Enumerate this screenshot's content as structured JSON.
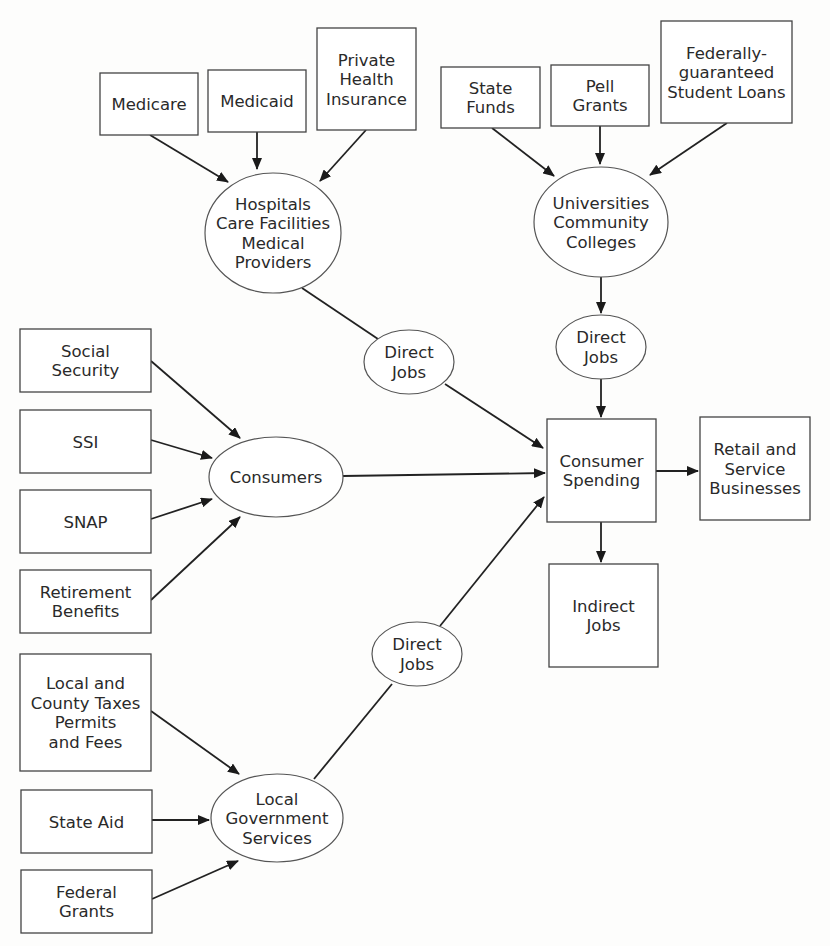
{
  "diagram": {
    "type": "flowchart",
    "nodes": [
      {
        "id": "medicare",
        "shape": "box",
        "lines": [
          "Medicare"
        ],
        "x": 100,
        "y": 73,
        "w": 98,
        "h": 62
      },
      {
        "id": "medicaid",
        "shape": "box",
        "lines": [
          "Medicaid"
        ],
        "x": 208,
        "y": 70,
        "w": 98,
        "h": 62
      },
      {
        "id": "private_health_insurance",
        "shape": "box",
        "lines": [
          "Private",
          "Health",
          "Insurance"
        ],
        "x": 317,
        "y": 28,
        "w": 99,
        "h": 102
      },
      {
        "id": "hospitals",
        "shape": "ellipse",
        "lines": [
          "Hospitals",
          "Care Facilities",
          "Medical",
          "Providers"
        ],
        "cx": 273,
        "cy": 233,
        "rx": 68,
        "ry": 60
      },
      {
        "id": "state_funds",
        "shape": "box",
        "lines": [
          "State",
          "Funds"
        ],
        "x": 441,
        "y": 67,
        "w": 99,
        "h": 61
      },
      {
        "id": "pell_grants",
        "shape": "box",
        "lines": [
          "Pell",
          "Grants"
        ],
        "x": 551,
        "y": 65,
        "w": 98,
        "h": 61
      },
      {
        "id": "student_loans",
        "shape": "box",
        "lines": [
          "Federally-",
          "guaranteed",
          "Student Loans"
        ],
        "x": 661,
        "y": 21,
        "w": 131,
        "h": 102
      },
      {
        "id": "universities",
        "shape": "ellipse",
        "lines": [
          "Universities",
          "Community",
          "Colleges"
        ],
        "cx": 601,
        "cy": 222,
        "rx": 67,
        "ry": 55
      },
      {
        "id": "direct_jobs_health",
        "shape": "ellipse",
        "lines": [
          "Direct",
          "Jobs"
        ],
        "cx": 409,
        "cy": 362,
        "rx": 45,
        "ry": 32
      },
      {
        "id": "direct_jobs_edu",
        "shape": "ellipse",
        "lines": [
          "Direct",
          "Jobs"
        ],
        "cx": 601,
        "cy": 347,
        "rx": 45,
        "ry": 32
      },
      {
        "id": "social_security",
        "shape": "box",
        "lines": [
          "Social",
          "Security"
        ],
        "x": 20,
        "y": 329,
        "w": 131,
        "h": 63
      },
      {
        "id": "ssi",
        "shape": "box",
        "lines": [
          "SSI"
        ],
        "x": 20,
        "y": 410,
        "w": 131,
        "h": 63
      },
      {
        "id": "snap",
        "shape": "box",
        "lines": [
          "SNAP"
        ],
        "x": 20,
        "y": 490,
        "w": 131,
        "h": 63
      },
      {
        "id": "retirement_benefits",
        "shape": "box",
        "lines": [
          "Retirement",
          "Benefits"
        ],
        "x": 20,
        "y": 570,
        "w": 131,
        "h": 63
      },
      {
        "id": "consumers",
        "shape": "ellipse",
        "lines": [
          "Consumers"
        ],
        "cx": 276,
        "cy": 477,
        "rx": 67,
        "ry": 40
      },
      {
        "id": "consumer_spending",
        "shape": "box",
        "lines": [
          "Consumer",
          "Spending"
        ],
        "x": 547,
        "y": 419,
        "w": 109,
        "h": 103
      },
      {
        "id": "retail_service",
        "shape": "box",
        "lines": [
          "Retail and",
          "Service",
          "Businesses"
        ],
        "x": 700,
        "y": 417,
        "w": 110,
        "h": 103
      },
      {
        "id": "indirect_jobs",
        "shape": "box",
        "lines": [
          "Indirect",
          "Jobs"
        ],
        "x": 549,
        "y": 564,
        "w": 109,
        "h": 103
      },
      {
        "id": "direct_jobs_gov",
        "shape": "ellipse",
        "lines": [
          "Direct",
          "Jobs"
        ],
        "cx": 417,
        "cy": 654,
        "rx": 45,
        "ry": 32
      },
      {
        "id": "local_county_taxes",
        "shape": "box",
        "lines": [
          "Local and",
          "County Taxes",
          "Permits",
          "and Fees"
        ],
        "x": 20,
        "y": 654,
        "w": 131,
        "h": 117
      },
      {
        "id": "state_aid",
        "shape": "box",
        "lines": [
          "State Aid"
        ],
        "x": 21,
        "y": 790,
        "w": 131,
        "h": 63
      },
      {
        "id": "federal_grants",
        "shape": "box",
        "lines": [
          "Federal",
          "Grants"
        ],
        "x": 21,
        "y": 870,
        "w": 131,
        "h": 63
      },
      {
        "id": "local_gov_services",
        "shape": "ellipse",
        "lines": [
          "Local",
          "Government",
          "Services"
        ],
        "cx": 277,
        "cy": 818,
        "rx": 66,
        "ry": 44
      }
    ],
    "edges": [
      {
        "from": "medicare",
        "to": "hospitals",
        "arrow": true,
        "x1": 150,
        "y1": 135,
        "x2": 228,
        "y2": 182
      },
      {
        "from": "medicaid",
        "to": "hospitals",
        "arrow": true,
        "x1": 257,
        "y1": 132,
        "x2": 257,
        "y2": 169
      },
      {
        "from": "private_health_insurance",
        "to": "hospitals",
        "arrow": true,
        "x1": 366,
        "y1": 130,
        "x2": 320,
        "y2": 181
      },
      {
        "from": "hospitals",
        "to": "direct_jobs_health",
        "arrow": false,
        "x1": 302,
        "y1": 288,
        "x2": 378,
        "y2": 339
      },
      {
        "from": "direct_jobs_health",
        "to": "consumer_spending",
        "arrow": true,
        "x1": 445,
        "y1": 384,
        "x2": 543,
        "y2": 448
      },
      {
        "from": "state_funds",
        "to": "universities",
        "arrow": true,
        "x1": 492,
        "y1": 128,
        "x2": 554,
        "y2": 176
      },
      {
        "from": "pell_grants",
        "to": "universities",
        "arrow": true,
        "x1": 600,
        "y1": 126,
        "x2": 600,
        "y2": 164
      },
      {
        "from": "student_loans",
        "to": "universities",
        "arrow": true,
        "x1": 727,
        "y1": 123,
        "x2": 650,
        "y2": 175
      },
      {
        "from": "universities",
        "to": "direct_jobs_edu",
        "arrow": true,
        "x1": 601,
        "y1": 277,
        "x2": 601,
        "y2": 313
      },
      {
        "from": "direct_jobs_edu",
        "to": "consumer_spending",
        "arrow": true,
        "x1": 601,
        "y1": 379,
        "x2": 601,
        "y2": 417
      },
      {
        "from": "social_security",
        "to": "consumers",
        "arrow": true,
        "x1": 151,
        "y1": 361,
        "x2": 240,
        "y2": 438
      },
      {
        "from": "ssi",
        "to": "consumers",
        "arrow": true,
        "x1": 151,
        "y1": 440,
        "x2": 212,
        "y2": 458
      },
      {
        "from": "snap",
        "to": "consumers",
        "arrow": true,
        "x1": 151,
        "y1": 519,
        "x2": 212,
        "y2": 499
      },
      {
        "from": "retirement_benefits",
        "to": "consumers",
        "arrow": true,
        "x1": 151,
        "y1": 600,
        "x2": 240,
        "y2": 517
      },
      {
        "from": "consumers",
        "to": "consumer_spending",
        "arrow": true,
        "x1": 343,
        "y1": 476,
        "x2": 545,
        "y2": 473
      },
      {
        "from": "consumer_spending",
        "to": "retail_service",
        "arrow": true,
        "x1": 656,
        "y1": 471,
        "x2": 698,
        "y2": 471
      },
      {
        "from": "consumer_spending",
        "to": "indirect_jobs",
        "arrow": true,
        "x1": 601,
        "y1": 522,
        "x2": 601,
        "y2": 562
      },
      {
        "from": "local_gov_services",
        "to": "direct_jobs_gov",
        "arrow": false,
        "x1": 314,
        "y1": 779,
        "x2": 392,
        "y2": 684
      },
      {
        "from": "direct_jobs_gov",
        "to": "consumer_spending",
        "arrow": true,
        "x1": 440,
        "y1": 626,
        "x2": 544,
        "y2": 497
      },
      {
        "from": "local_county_taxes",
        "to": "local_gov_services",
        "arrow": true,
        "x1": 151,
        "y1": 711,
        "x2": 239,
        "y2": 774
      },
      {
        "from": "state_aid",
        "to": "local_gov_services",
        "arrow": true,
        "x1": 152,
        "y1": 820,
        "x2": 209,
        "y2": 820
      },
      {
        "from": "federal_grants",
        "to": "local_gov_services",
        "arrow": true,
        "x1": 152,
        "y1": 899,
        "x2": 238,
        "y2": 861
      }
    ]
  }
}
